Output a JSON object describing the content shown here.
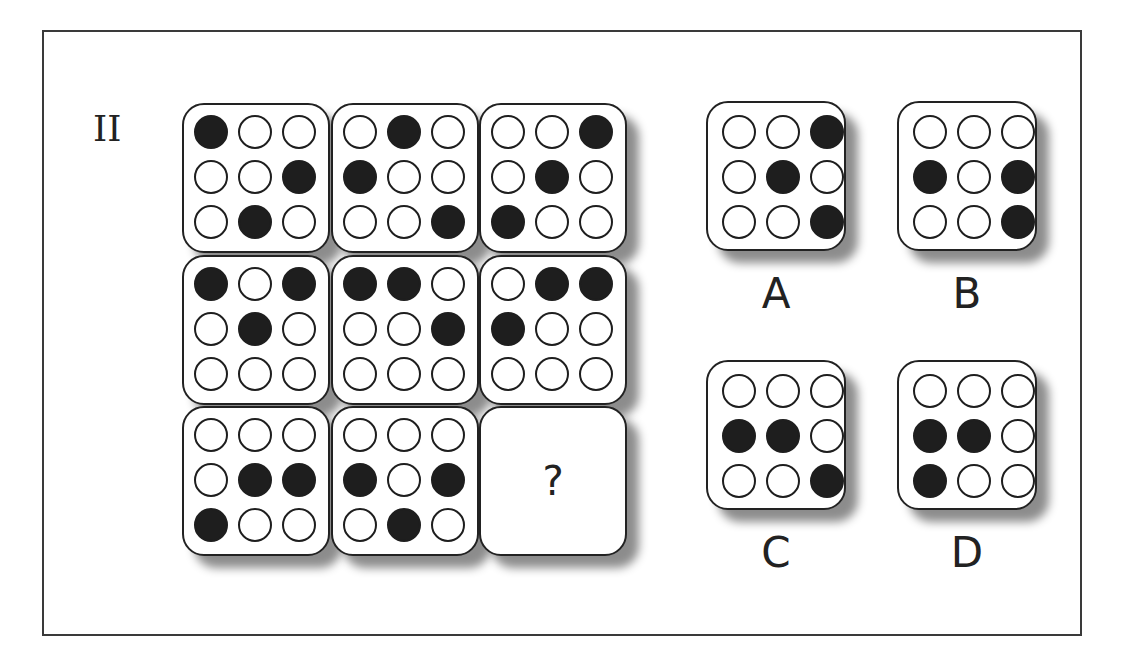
{
  "puzzle": {
    "number": "II",
    "matrix": [
      {
        "id": "r1c1",
        "dots": [
          1,
          0,
          0,
          0,
          0,
          1,
          0,
          1,
          0
        ]
      },
      {
        "id": "r1c2",
        "dots": [
          0,
          1,
          0,
          1,
          0,
          0,
          0,
          0,
          1
        ]
      },
      {
        "id": "r1c3",
        "dots": [
          0,
          0,
          1,
          0,
          1,
          0,
          1,
          0,
          0
        ]
      },
      {
        "id": "r2c1",
        "dots": [
          1,
          0,
          1,
          0,
          1,
          0,
          0,
          0,
          0
        ]
      },
      {
        "id": "r2c2",
        "dots": [
          1,
          1,
          0,
          0,
          0,
          1,
          0,
          0,
          0
        ]
      },
      {
        "id": "r2c3",
        "dots": [
          0,
          1,
          1,
          1,
          0,
          0,
          0,
          0,
          0
        ]
      },
      {
        "id": "r3c1",
        "dots": [
          0,
          0,
          0,
          0,
          1,
          1,
          1,
          0,
          0
        ]
      },
      {
        "id": "r3c2",
        "dots": [
          0,
          0,
          0,
          1,
          0,
          1,
          0,
          1,
          0
        ]
      },
      {
        "id": "r3c3",
        "missing": true,
        "placeholder": "?"
      }
    ],
    "options": [
      {
        "label": "A",
        "dots": [
          0,
          0,
          1,
          0,
          1,
          0,
          0,
          0,
          1
        ]
      },
      {
        "label": "B",
        "dots": [
          0,
          0,
          0,
          1,
          0,
          1,
          0,
          0,
          1
        ]
      },
      {
        "label": "C",
        "dots": [
          0,
          0,
          0,
          1,
          1,
          0,
          0,
          0,
          1
        ]
      },
      {
        "label": "D",
        "dots": [
          0,
          0,
          0,
          1,
          1,
          0,
          1,
          0,
          0
        ]
      }
    ],
    "colors": {
      "filled": "#1e1e1e",
      "empty": "#ffffff",
      "border": "#222222"
    }
  }
}
